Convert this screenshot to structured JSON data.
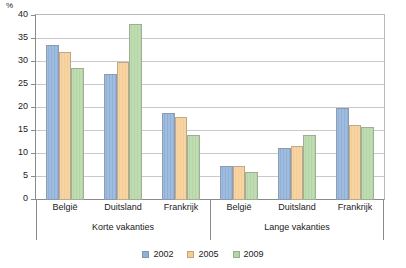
{
  "chart_data": {
    "type": "bar",
    "title": "",
    "subtitle": "",
    "xlabel": "",
    "ylabel": "%",
    "unit_label": "%",
    "ylim": [
      0,
      40
    ],
    "ytick_step": 5,
    "yticks": [
      0,
      5,
      10,
      15,
      20,
      25,
      30,
      35,
      40
    ],
    "ytick_labels": [
      "0",
      "5",
      "10",
      "15",
      "20",
      "25",
      "30",
      "35",
      "40"
    ],
    "grid": true,
    "legend_position": "bottom",
    "categories": [
      "België",
      "Duitsland",
      "Frankrijk",
      "België",
      "Duitsland",
      "Frankrijk"
    ],
    "panels": [
      {
        "label": "Korte vakanties",
        "categories": [
          "België",
          "Duitsland",
          "Frankrijk"
        ]
      },
      {
        "label": "Lange vakanties",
        "categories": [
          "België",
          "Duitsland",
          "Frankrijk"
        ]
      }
    ],
    "series": [
      {
        "name": "2002",
        "color": "#8fb0d8",
        "values": [
          33.7,
          27.3,
          18.9,
          7.3,
          11.3,
          20.0
        ]
      },
      {
        "name": "2005",
        "color": "#f5cd93",
        "values": [
          32.2,
          30.0,
          18.0,
          7.3,
          11.8,
          16.2
        ]
      },
      {
        "name": "2009",
        "color": "#b4d6a4",
        "values": [
          28.8,
          38.3,
          14.1,
          6.1,
          14.2,
          15.8
        ]
      }
    ],
    "legend": [
      {
        "label": "2002",
        "color": "#8fb0d8"
      },
      {
        "label": "2005",
        "color": "#f5cd93"
      },
      {
        "label": "2009",
        "color": "#b4d6a4"
      }
    ],
    "colors": {
      "series_2002": "#8fb0d8",
      "series_2005": "#f5cd93",
      "series_2009": "#b4d6a4",
      "gridline": "#c9c9c9",
      "axis": "#8a8a8a",
      "text": "#1a1a1a",
      "background": "#ffffff"
    }
  }
}
